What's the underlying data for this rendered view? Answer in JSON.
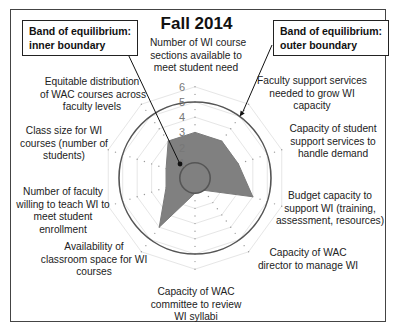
{
  "chart_data": {
    "type": "radar",
    "title": "Fall 2014",
    "axes": [
      "Number of WI course sections available to meet student need",
      "Faculty support services needed to grow WI capacity",
      "Capacity of student support services to handle demand",
      "Budget capacity to support WI (training, assessment, resources)",
      "Capacity of WAC director to manage WI",
      "Capacity of WAC committee to review WI syllabi",
      "Availability of classroom space for WI courses",
      "Number of faculty willing to teach WI to meet student enrollment",
      "Class size for WI courses (number of students)",
      "Equitable distribution of WAC courses across faculty levels"
    ],
    "series": [
      {
        "name": "Fall 2014",
        "values": [
          3,
          3,
          3,
          4,
          1,
          1,
          4,
          2,
          2,
          3
        ]
      }
    ],
    "scale": {
      "min": 0,
      "max": 6,
      "ticks": [
        "0",
        "1",
        "2",
        "3",
        "4",
        "5",
        "6"
      ]
    },
    "band_of_equilibrium": {
      "inner": 1,
      "outer": 5
    },
    "annotations": [
      "Band of equilibrium: inner boundary",
      "Band of equilibrium: outer boundary"
    ],
    "grid": true,
    "colors": {
      "fill": "#808080",
      "boundary": "#555555",
      "grid": "#e6e6e6"
    }
  },
  "title": "Fall 2014",
  "callouts": {
    "inner": [
      "Band of equilibrium:",
      "inner boundary"
    ],
    "outer": [
      "Band of equilibrium:",
      "outer boundary"
    ]
  },
  "axis_labels": [
    [
      "Number of WI course",
      "sections available to",
      "meet student need"
    ],
    [
      "Faculty support services",
      "needed to grow WI",
      "capacity"
    ],
    [
      "Capacity of student",
      "support services to",
      "handle demand"
    ],
    [
      "Budget capacity to",
      "support WI (training,",
      "assessment, resources)"
    ],
    [
      "Capacity of WAC",
      "director to manage WI"
    ],
    [
      "Capacity of WAC",
      "committee to review",
      "WI syllabi"
    ],
    [
      "Availability of",
      "classroom space for WI",
      "courses"
    ],
    [
      "Number of faculty",
      "willing to teach WI to",
      "meet student",
      "enrollment"
    ],
    [
      "Class size for WI",
      "courses (number of",
      "students)"
    ],
    [
      "Equitable distribution",
      "of WAC courses across",
      "faculty levels"
    ]
  ]
}
